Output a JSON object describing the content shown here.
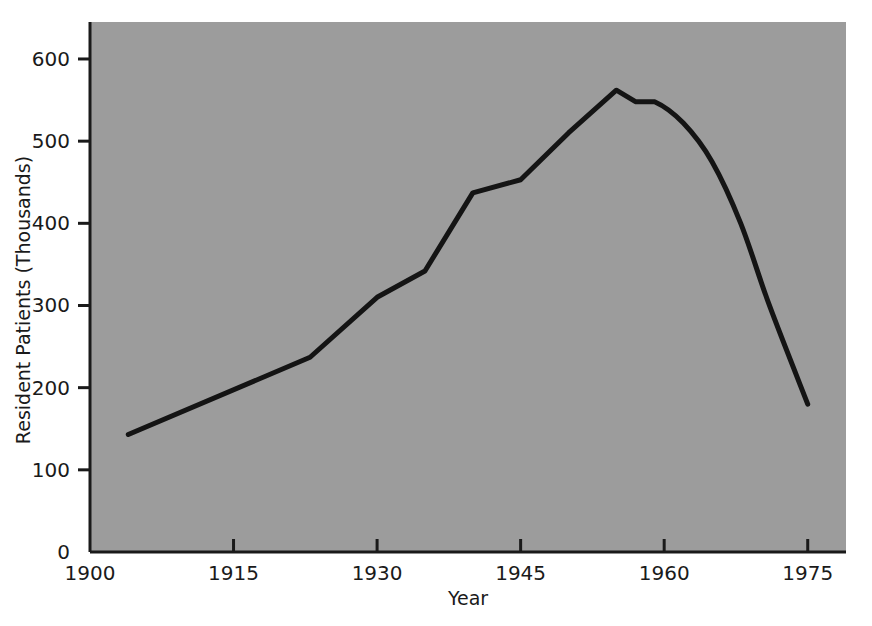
{
  "figure": {
    "background_color": "#ffffff",
    "plot_background_color": "#9c9c9c",
    "line_color": "#141414",
    "axis_color": "#1a1a1a",
    "text_color": "#1a1a1a"
  },
  "chart_data": {
    "type": "line",
    "title": "",
    "subtitle": "",
    "xlabel": "Year",
    "ylabel": "Resident Patients (Thousands)",
    "xlim": [
      1900,
      1979
    ],
    "ylim": [
      0,
      645
    ],
    "xticks": [
      1900,
      1915,
      1930,
      1945,
      1960,
      1975
    ],
    "xtick_labels": [
      "1900",
      "1915",
      "1930",
      "1945",
      "1960",
      "1975"
    ],
    "yticks": [
      0,
      100,
      200,
      300,
      400,
      500,
      600
    ],
    "ytick_labels": [
      "0",
      "100",
      "200",
      "300",
      "400",
      "500",
      "600"
    ],
    "grid": false,
    "legend": null,
    "annotations": [],
    "series": [
      {
        "name": "Resident Patients",
        "x": [
          1904,
          1923,
          1930,
          1935,
          1940,
          1945,
          1950,
          1955,
          1957,
          1959,
          1962,
          1965,
          1968,
          1971,
          1975
        ],
        "values": [
          143,
          237,
          310,
          342,
          437,
          453,
          510,
          562,
          548,
          548,
          522,
          475,
          400,
          300,
          180
        ]
      }
    ]
  },
  "axis_label_x": "Year",
  "axis_label_y": "Resident Patients (Thousands)"
}
